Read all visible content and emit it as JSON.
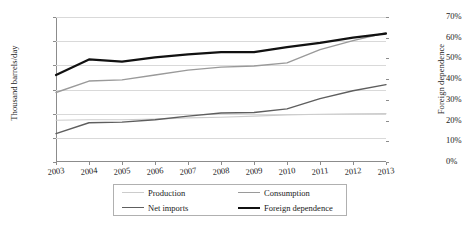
{
  "chart_data": {
    "type": "line",
    "title": "",
    "xlabel": "",
    "ylabel": "Thousand barrels/day",
    "y2label": "Foreign dependence",
    "grid": true,
    "legend_position": "bottom",
    "categories": [
      "2003",
      "2004",
      "2005",
      "2006",
      "2007",
      "2008",
      "2009",
      "2010",
      "2011",
      "2012",
      "2013"
    ],
    "ylim": [
      0,
      12000
    ],
    "yticks": [
      "0",
      "2000",
      "4000",
      "6000",
      "8000",
      "10000",
      "12000"
    ],
    "y2lim": [
      0,
      70
    ],
    "y2ticks": [
      "0%",
      "10%",
      "20%",
      "30%",
      "40%",
      "50%",
      "60%",
      "70%"
    ],
    "series": [
      {
        "name": "Production",
        "axis": "left",
        "color": "#cccccc",
        "width": 1.1,
        "values": [
          3450,
          3500,
          3500,
          3550,
          3650,
          3700,
          3800,
          3900,
          3950,
          3980,
          4000
        ]
      },
      {
        "name": "Consumption",
        "axis": "left",
        "color": "#9a9a9a",
        "width": 1.4,
        "values": [
          5750,
          6700,
          6800,
          7200,
          7600,
          7850,
          7950,
          8200,
          9300,
          10050,
          10700
        ]
      },
      {
        "name": "Net imports",
        "axis": "left",
        "color": "#5e5e5e",
        "width": 1.4,
        "values": [
          2350,
          3250,
          3300,
          3500,
          3800,
          4050,
          4100,
          4400,
          5250,
          5900,
          6400
        ]
      },
      {
        "name": "Foreign dependence",
        "axis": "right",
        "color": "#111111",
        "width": 2.2,
        "values": [
          42.0,
          49.5,
          48.5,
          50.5,
          52.0,
          53.0,
          53.0,
          55.5,
          57.5,
          60.0,
          62.0
        ]
      }
    ]
  },
  "legend": {
    "items": [
      {
        "label": "Production"
      },
      {
        "label": "Consumption"
      },
      {
        "label": "Net imports"
      },
      {
        "label": "Foreign dependence"
      }
    ]
  }
}
